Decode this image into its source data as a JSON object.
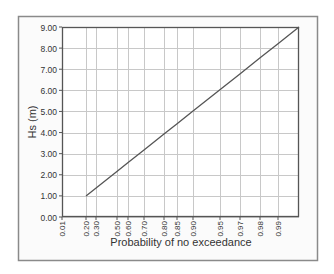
{
  "chart_data": {
    "type": "line",
    "title": "",
    "xlabel": "Probability of no exceedance",
    "ylabel": "Hs (m)",
    "x_tick_labels": [
      "0.01",
      "0.20",
      "0.30",
      "0.50",
      "0.60",
      "0.70",
      "0.80",
      "0.85",
      "0.90",
      "0.95",
      "0.97",
      "0.98",
      "0.99"
    ],
    "y_tick_labels": [
      "0.00",
      "1.00",
      "2.00",
      "3.00",
      "4.00",
      "5.00",
      "6.00",
      "7.00",
      "8.00",
      "9.00"
    ],
    "ylim": [
      0,
      9
    ],
    "grid": true,
    "legend": null,
    "x_scale": "probability (non-linear)",
    "series": [
      {
        "name": "Hs",
        "x": [
          0.2,
          0.3,
          0.5,
          0.6,
          0.7,
          0.8,
          0.85,
          0.9,
          0.95,
          0.97,
          0.98,
          0.99,
          0.995
        ],
        "values": [
          1.0,
          1.38,
          2.16,
          2.58,
          3.18,
          3.93,
          4.42,
          5.02,
          6.03,
          6.78,
          7.54,
          8.21,
          9.0
        ]
      }
    ]
  },
  "layout": {
    "frame": {
      "x": 18,
      "y": 16,
      "w": 299,
      "h": 244
    },
    "plot": {
      "x": 62,
      "y": 27,
      "w": 237,
      "h": 190
    },
    "x_tick_px": [
      62,
      86,
      96,
      117,
      128,
      144,
      164,
      177,
      193,
      220,
      240,
      260,
      278
    ],
    "line_start": {
      "px": 86,
      "value": 1.0
    },
    "line_end": {
      "px": 299,
      "value": 9.0
    }
  },
  "colors": {
    "frame_border": "#8a8a8a",
    "frame_bg": "#fbfbfb",
    "plot_bg": "#ffffff",
    "axis": "#555555",
    "grid": "#c8c8c8",
    "line": "#555555",
    "text": "#333333"
  }
}
